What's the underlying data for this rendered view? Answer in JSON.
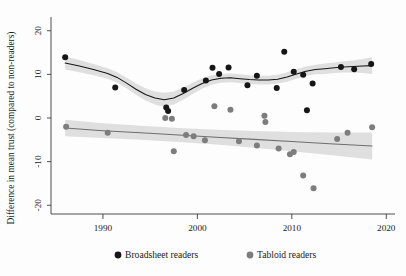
{
  "chart_data": {
    "type": "scatter",
    "title": "",
    "xlabel": "",
    "ylabel": "Difference in mean trust (compared to non-readers)",
    "xlim": [
      1984.5,
      2020.5
    ],
    "ylim": [
      -22,
      22
    ],
    "xticks": [
      1990,
      2000,
      2010,
      2020
    ],
    "xticklabels": [
      "1990",
      "2000",
      "2010",
      "2020"
    ],
    "yticks": [
      -20,
      -10,
      0,
      10,
      20
    ],
    "yticklabels": [
      "-20",
      "-10",
      "0",
      "10",
      "20"
    ],
    "grid": false,
    "legend_position": "below-axes",
    "legend": [
      {
        "label": "Broadsheet readers",
        "color": "#161616",
        "marker": "circle"
      },
      {
        "label": "Tabloid readers",
        "color": "#7d7d7d",
        "marker": "circle"
      }
    ],
    "series": [
      {
        "name": "Broadsheet readers",
        "type": "scatter",
        "color": "#161616",
        "points": [
          {
            "x": 1986.0,
            "y": 13.9
          },
          {
            "x": 1991.3,
            "y": 7.0
          },
          {
            "x": 1996.7,
            "y": 2.4
          },
          {
            "x": 1996.9,
            "y": 1.6
          },
          {
            "x": 1998.6,
            "y": 6.4
          },
          {
            "x": 2000.9,
            "y": 8.6
          },
          {
            "x": 2001.6,
            "y": 11.5
          },
          {
            "x": 2002.3,
            "y": 10.1
          },
          {
            "x": 2003.3,
            "y": 11.6
          },
          {
            "x": 2005.3,
            "y": 7.5
          },
          {
            "x": 2006.3,
            "y": 9.7
          },
          {
            "x": 2008.4,
            "y": 6.9
          },
          {
            "x": 2009.2,
            "y": 15.2
          },
          {
            "x": 2010.2,
            "y": 10.6
          },
          {
            "x": 2011.2,
            "y": 9.9
          },
          {
            "x": 2011.6,
            "y": 1.8
          },
          {
            "x": 2012.2,
            "y": 7.9
          },
          {
            "x": 2015.2,
            "y": 11.7
          },
          {
            "x": 2016.6,
            "y": 11.2
          },
          {
            "x": 2018.4,
            "y": 12.4
          }
        ]
      },
      {
        "name": "Tabloid readers",
        "type": "scatter",
        "color": "#7d7d7d",
        "points": [
          {
            "x": 1986.1,
            "y": -2.0
          },
          {
            "x": 1990.5,
            "y": -3.4
          },
          {
            "x": 1996.6,
            "y": 0.0
          },
          {
            "x": 1997.3,
            "y": -0.2
          },
          {
            "x": 1997.5,
            "y": -7.6
          },
          {
            "x": 1998.8,
            "y": -3.9
          },
          {
            "x": 1999.6,
            "y": -4.2
          },
          {
            "x": 2000.8,
            "y": -5.1
          },
          {
            "x": 2001.8,
            "y": 2.7
          },
          {
            "x": 2003.5,
            "y": 1.9
          },
          {
            "x": 2004.4,
            "y": -5.3
          },
          {
            "x": 2006.3,
            "y": -6.3
          },
          {
            "x": 2007.1,
            "y": 0.5
          },
          {
            "x": 2007.2,
            "y": -0.9
          },
          {
            "x": 2008.6,
            "y": -7.0
          },
          {
            "x": 2009.8,
            "y": -8.3
          },
          {
            "x": 2010.2,
            "y": -7.8
          },
          {
            "x": 2011.2,
            "y": -13.2
          },
          {
            "x": 2012.3,
            "y": -16.1
          },
          {
            "x": 2014.8,
            "y": -4.8
          },
          {
            "x": 2015.9,
            "y": -3.4
          },
          {
            "x": 2018.5,
            "y": -2.1
          }
        ]
      }
    ],
    "fits": [
      {
        "name": "Broadsheet trend",
        "color": "#161616",
        "band_color": "#d9d9d9",
        "line": [
          {
            "x": 1986.0,
            "y": 12.6
          },
          {
            "x": 1987.5,
            "y": 11.9
          },
          {
            "x": 1989.0,
            "y": 11.1
          },
          {
            "x": 1990.5,
            "y": 10.2
          },
          {
            "x": 1991.5,
            "y": 9.3
          },
          {
            "x": 1992.5,
            "y": 8.0
          },
          {
            "x": 1993.5,
            "y": 6.6
          },
          {
            "x": 1994.5,
            "y": 5.4
          },
          {
            "x": 1995.5,
            "y": 4.6
          },
          {
            "x": 1996.5,
            "y": 4.2
          },
          {
            "x": 1997.5,
            "y": 4.6
          },
          {
            "x": 1998.5,
            "y": 5.6
          },
          {
            "x": 1999.5,
            "y": 6.8
          },
          {
            "x": 2000.5,
            "y": 7.9
          },
          {
            "x": 2001.5,
            "y": 8.7
          },
          {
            "x": 2002.5,
            "y": 9.1
          },
          {
            "x": 2003.5,
            "y": 9.2
          },
          {
            "x": 2004.5,
            "y": 9.0
          },
          {
            "x": 2005.5,
            "y": 8.8
          },
          {
            "x": 2006.5,
            "y": 8.7
          },
          {
            "x": 2007.5,
            "y": 8.7
          },
          {
            "x": 2008.5,
            "y": 8.9
          },
          {
            "x": 2009.5,
            "y": 9.4
          },
          {
            "x": 2010.5,
            "y": 10.1
          },
          {
            "x": 2011.5,
            "y": 10.7
          },
          {
            "x": 2012.5,
            "y": 11.1
          },
          {
            "x": 2013.5,
            "y": 11.3
          },
          {
            "x": 2014.5,
            "y": 11.5
          },
          {
            "x": 2015.5,
            "y": 11.7
          },
          {
            "x": 2016.5,
            "y": 11.8
          },
          {
            "x": 2017.5,
            "y": 11.9
          },
          {
            "x": 2018.5,
            "y": 12.0
          }
        ],
        "band_halfwidth": [
          1.5,
          1.4,
          1.3,
          1.2,
          1.2,
          1.2,
          1.3,
          1.4,
          1.5,
          1.6,
          1.5,
          1.4,
          1.3,
          1.2,
          1.1,
          1.0,
          1.0,
          1.0,
          1.0,
          1.0,
          1.0,
          1.0,
          1.1,
          1.1,
          1.1,
          1.1,
          1.2,
          1.2,
          1.3,
          1.4,
          1.6,
          1.9
        ]
      },
      {
        "name": "Tabloid trend",
        "color": "#6e6e6e",
        "band_color": "#d9d9d9",
        "line": [
          {
            "x": 1986.0,
            "y": -2.3
          },
          {
            "x": 1990.0,
            "y": -2.9
          },
          {
            "x": 1994.0,
            "y": -3.4
          },
          {
            "x": 1998.0,
            "y": -3.9
          },
          {
            "x": 2002.0,
            "y": -4.4
          },
          {
            "x": 2006.0,
            "y": -4.9
          },
          {
            "x": 2010.0,
            "y": -5.4
          },
          {
            "x": 2014.0,
            "y": -5.9
          },
          {
            "x": 2018.5,
            "y": -6.4
          }
        ],
        "band_halfwidth": [
          1.9,
          1.7,
          1.6,
          1.6,
          1.7,
          1.9,
          2.2,
          2.6,
          3.1
        ]
      }
    ]
  },
  "axes": {
    "ylabel": "Difference in mean trust (compared to non-readers)"
  }
}
